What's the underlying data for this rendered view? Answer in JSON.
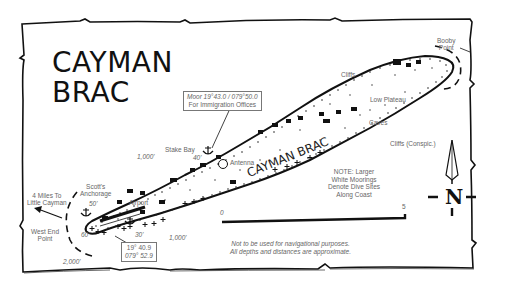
{
  "title": {
    "line1": "CAYMAN",
    "line2": "BRAC"
  },
  "island_label": "CAYMAN BRAC",
  "immigration_box": {
    "line1": "Moor 19°43.0 / 079°50.0",
    "line2": "For Immigration Offices"
  },
  "coord_box": {
    "line1": "19° 40.9",
    "line2": "079° 52.9"
  },
  "places": {
    "booby_point": {
      "line1": "Booby",
      "line2": "Point"
    },
    "cliffs": "Cliffs",
    "low_plateau": "Low Plateau",
    "caves": "Caves",
    "cliffs_conspic": "Cliffs (Conspic.)",
    "stake_bay": "Stake Bay",
    "antenna": "Antenna",
    "scotts_anchorage": {
      "line1": "Scott's",
      "line2": "Anchorage"
    },
    "airport": "Airport",
    "west_end_point": {
      "line1": "West End",
      "line2": "Point"
    },
    "little_cayman": {
      "line1": "4 Miles To",
      "line2": "Little Cayman"
    }
  },
  "depths": {
    "d1000_north": "1,000'",
    "d40": "40'",
    "d50": "50'",
    "d60": "60'",
    "d30": "30'",
    "d1000_south": "1,000'",
    "d2000": "2,000'"
  },
  "note": {
    "line1": "NOTE: Larger",
    "line2": "White Moorings",
    "line3": "Denote Dive Sites",
    "line4": "Along Coast"
  },
  "scale": {
    "start": "0",
    "end": "5"
  },
  "disclaimer": {
    "line1": "Not to be used for navigational purposes.",
    "line2": "All depths and distances are approximate."
  },
  "compass": {
    "label": "N"
  },
  "colors": {
    "ink": "#111111",
    "text": "#666666",
    "paper": "#ffffff"
  }
}
